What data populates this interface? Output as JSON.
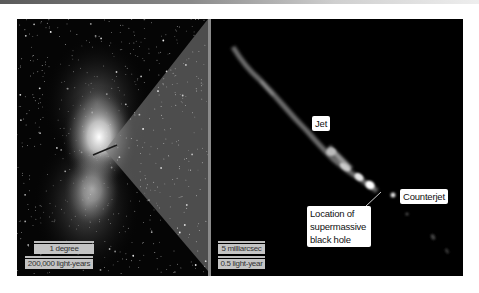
{
  "figure": {
    "left_panel": {
      "description": "Wide-field galaxy image with stars",
      "scale_bars": [
        {
          "label": "1 degree"
        },
        {
          "label": "200,000 light-years"
        }
      ]
    },
    "right_panel": {
      "description": "Zoomed radio image of jet",
      "scale_bars": [
        {
          "label": "5 milliarcsec"
        },
        {
          "label": "0.5 light-year"
        }
      ],
      "annotations": {
        "jet": "Jet",
        "counterjet": "Counterjet",
        "black_hole_line1": "Location of",
        "black_hole_line2": "supermassive",
        "black_hole_line3": "black hole"
      }
    }
  }
}
